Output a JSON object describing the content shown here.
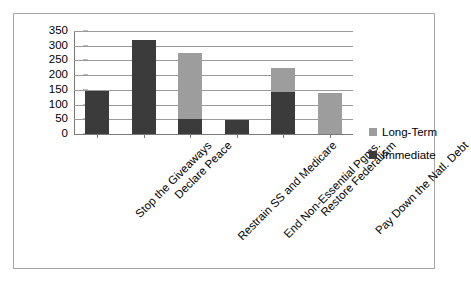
{
  "chart_data": {
    "type": "bar",
    "stacked": true,
    "title": "",
    "xlabel": "",
    "ylabel": "",
    "ylim": [
      0,
      350
    ],
    "ytick_step": 50,
    "yticks": [
      350,
      300,
      250,
      200,
      150,
      100,
      50,
      0
    ],
    "grid": true,
    "legend_position": "right",
    "categories": [
      "Stop the Giveaways",
      "Declare Peace",
      "Restrain SS and Medicare",
      "End Non-Essential Pgms.",
      "Restore Federalism",
      "Pay Down the Natl. Debt"
    ],
    "series": [
      {
        "name": "Immediate",
        "color": "#3b3b3b",
        "values": [
          145,
          318,
          50,
          48,
          142,
          0
        ]
      },
      {
        "name": "Long-Term",
        "color": "#9d9d9d",
        "values": [
          0,
          0,
          225,
          0,
          84,
          140
        ]
      }
    ],
    "totals": [
      145,
      318,
      275,
      48,
      226,
      140
    ]
  },
  "legend": {
    "items": [
      {
        "label": "Long-Term",
        "color": "#9d9d9d"
      },
      {
        "label": "Immediate",
        "color": "#3b3b3b"
      }
    ]
  },
  "colors": {
    "immediate": "#3b3b3b",
    "long_term": "#9d9d9d",
    "gridline": "#9a9a9a",
    "axis": "#7a7a7a",
    "frame_border": "#a6a6a6",
    "background": "#ffffff"
  }
}
